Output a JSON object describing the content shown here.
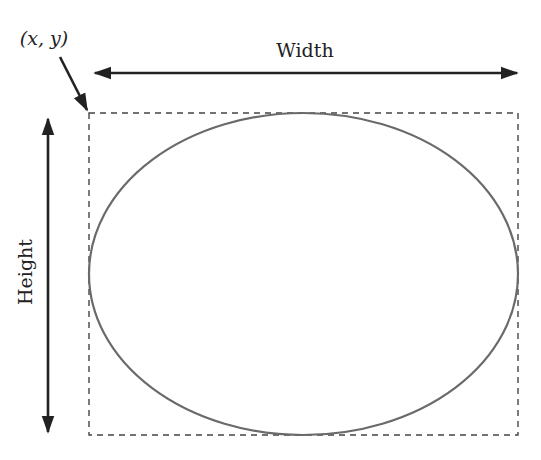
{
  "diagram": {
    "point_label": "(x, y)",
    "width_label": "Width",
    "height_label": "Height",
    "colors": {
      "arrow": "#222222",
      "ellipse_stroke": "#6a6a6a",
      "bounding_box": "#444444",
      "text": "#222222",
      "background": "#ffffff"
    },
    "shapes": [
      {
        "type": "bounding-box",
        "style": "dashed"
      },
      {
        "type": "ellipse",
        "style": "solid"
      }
    ],
    "arrows": [
      {
        "name": "width-arrow",
        "direction": "horizontal",
        "heads": "both"
      },
      {
        "name": "height-arrow",
        "direction": "vertical",
        "heads": "both"
      },
      {
        "name": "origin-pointer-arrow",
        "direction": "diagonal",
        "heads": "end"
      }
    ]
  }
}
